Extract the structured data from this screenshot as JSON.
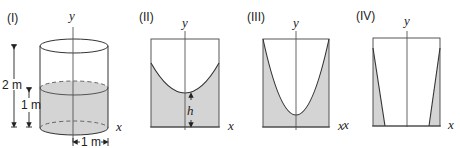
{
  "panels": [
    {
      "id": "I",
      "label": "(I)",
      "shape": "cylinder",
      "axis_y": "y",
      "axis_x": "x",
      "dimensions": {
        "total_height": "2 m",
        "water_height": "1 m",
        "radius": "1 m"
      }
    },
    {
      "id": "II",
      "label": "(II)",
      "shape": "cross-section, water surface concave up (paraboloid), min height h at axis",
      "axis_y": "y",
      "axis_x": "x",
      "annotation": "h"
    },
    {
      "id": "III",
      "label": "(III)",
      "shape": "cross-section, deep paraboloid surface near bottom",
      "axis_y": "y",
      "axis_x": "x"
    },
    {
      "id": "IV",
      "label": "(IV)",
      "shape": "cross-section, water pressed against walls (thin wedges)",
      "axis_y": "y",
      "axis_x_left": "x",
      "axis_x_right": "x"
    }
  ],
  "colors": {
    "line": "#333333",
    "fill": "#d4d4d4",
    "axis": "#555555"
  }
}
